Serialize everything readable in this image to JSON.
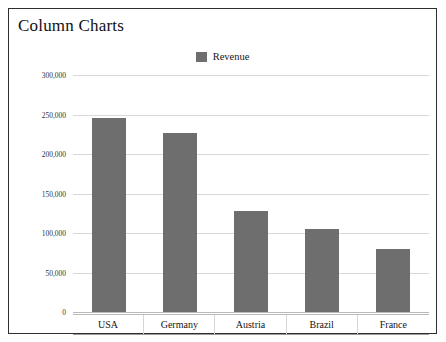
{
  "panel": {
    "title": "Column Charts",
    "border_color": "#2e2e2e",
    "background": "#ffffff"
  },
  "legend": {
    "position": "top-center",
    "entries": [
      {
        "label": "Revenue",
        "color": "#6e6e6e",
        "marker": "square-swatch-icon"
      }
    ]
  },
  "chart_data": {
    "type": "bar",
    "title": "Column Charts",
    "xlabel": "",
    "ylabel": "",
    "categories": [
      "USA",
      "Germany",
      "Austria",
      "Brazil",
      "France"
    ],
    "series": [
      {
        "name": "Revenue",
        "color": "#6e6e6e",
        "values": [
          247000,
          228000,
          129000,
          106000,
          81000
        ]
      }
    ],
    "ylim": [
      0,
      300000
    ],
    "ytick_values": [
      0,
      50000,
      100000,
      150000,
      200000,
      250000,
      300000
    ],
    "ytick_labels": [
      "0",
      "50,000",
      "100,000",
      "150,000",
      "200,000",
      "250,000",
      "300,000"
    ],
    "grid": true,
    "grid_color": "#d8d8d8",
    "legend_position": "top-center"
  }
}
